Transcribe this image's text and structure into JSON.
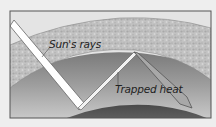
{
  "diagram": {
    "labels": {
      "sun_rays": "Sun's rays",
      "trapped_heat": "Trapped heat"
    },
    "colors": {
      "background": "#eeeeee",
      "frame": "#555555",
      "sky_top": "#e6e6e6",
      "atmosphere": "#bdbdbd",
      "lower_sky": "#8f8f8f",
      "earth": "#5a5a5a",
      "ray": "#ffffff"
    }
  }
}
